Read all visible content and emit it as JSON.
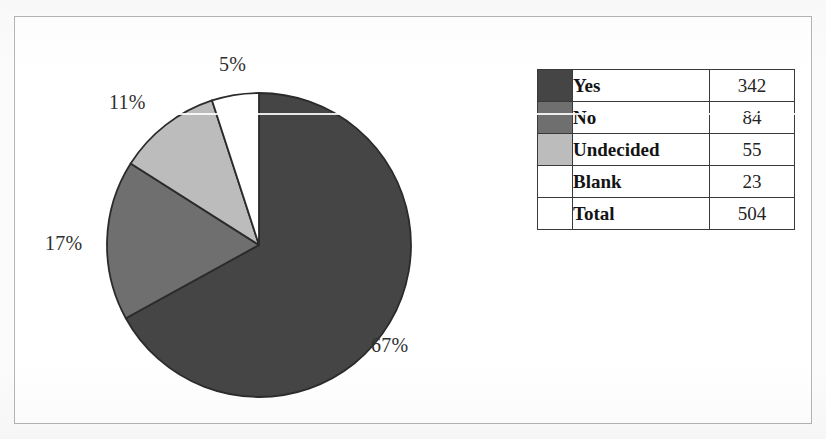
{
  "figure": {
    "frame_border_color": "#b4b4b4",
    "background_color": "#ffffff",
    "page_background_color": "#f2f2f2"
  },
  "chart_data": {
    "type": "pie",
    "title": "",
    "xlabel": "",
    "ylabel": "",
    "categories": [
      "Yes",
      "No",
      "Undecided",
      "Blank"
    ],
    "values": [
      342,
      84,
      55,
      23
    ],
    "percent_labels": [
      "67%",
      "17%",
      "11%",
      "5%"
    ],
    "percents": [
      67,
      17,
      11,
      5
    ],
    "total_label": "Total",
    "total_value": 504,
    "colors": [
      "#454545",
      "#6f6f6f",
      "#bcbcbc",
      "#ffffff"
    ],
    "slice_outline_color": "#2b2b2b",
    "start_angle_deg": 0,
    "direction": "clockwise",
    "legend_position": "right",
    "grid": false
  },
  "pie": {
    "center_x": 154,
    "center_y": 154,
    "radius": 152,
    "labels": {
      "yes": "67%",
      "no": "17%",
      "undecided": "11%",
      "blank": "5%"
    }
  },
  "legend": {
    "rows": [
      {
        "label": "Yes",
        "value": "342",
        "color": "#454545",
        "has_swatch": true
      },
      {
        "label": "No",
        "value": "84",
        "color": "#6f6f6f",
        "has_swatch": true
      },
      {
        "label": "Undecided",
        "value": "55",
        "color": "#bcbcbc",
        "has_swatch": true
      },
      {
        "label": "Blank",
        "value": "23",
        "color": "#ffffff",
        "has_swatch": true
      },
      {
        "label": "Total",
        "value": "504",
        "color": null,
        "has_swatch": false
      }
    ]
  }
}
